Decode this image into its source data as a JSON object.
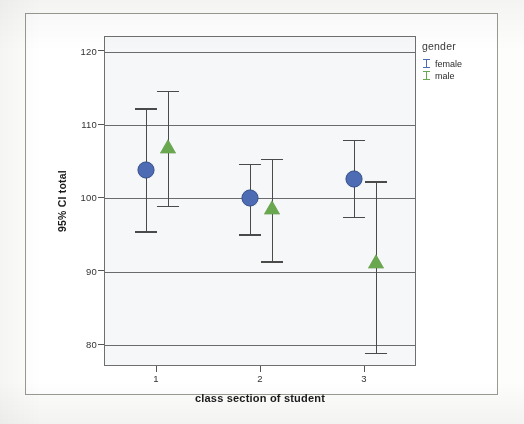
{
  "chart_data": {
    "type": "scatter",
    "title": "",
    "subtitle": "",
    "xlabel": "class section of student",
    "ylabel": "95% CI total",
    "categories": [
      "1",
      "2",
      "3"
    ],
    "xtick_labels": [
      "1",
      "2",
      "3"
    ],
    "ytick_labels": [
      "80",
      "90",
      "100",
      "110",
      "120"
    ],
    "ytick_values": [
      80,
      90,
      100,
      110,
      120
    ],
    "ylim": [
      77,
      122
    ],
    "grid": "horizontal",
    "legend_position": "right",
    "legend_title": "gender",
    "error_bar_type": "95% CI",
    "series": [
      {
        "name": "female",
        "color": "#4d6cb3",
        "marker": "circle",
        "points": [
          {
            "category": "1",
            "mean": 103.8,
            "ci_lower": 95.5,
            "ci_upper": 112.3
          },
          {
            "category": "2",
            "mean": 100.0,
            "ci_lower": 95.1,
            "ci_upper": 104.7
          },
          {
            "category": "3",
            "mean": 102.7,
            "ci_lower": 97.5,
            "ci_upper": 108.0
          }
        ]
      },
      {
        "name": "male",
        "color": "#6aa84f",
        "marker": "triangle",
        "points": [
          {
            "category": "1",
            "mean": 106.8,
            "ci_lower": 99.0,
            "ci_upper": 114.7
          },
          {
            "category": "2",
            "mean": 98.6,
            "ci_lower": 91.4,
            "ci_upper": 105.4
          },
          {
            "category": "3",
            "mean": 91.2,
            "ci_lower": 78.9,
            "ci_upper": 102.3
          }
        ]
      }
    ]
  },
  "axes": {
    "y_title": "95% CI total",
    "x_title": "class section of student",
    "y_ticks": [
      {
        "label": "120",
        "value": 120
      },
      {
        "label": "110",
        "value": 110
      },
      {
        "label": "100",
        "value": 100
      },
      {
        "label": "90",
        "value": 90
      },
      {
        "label": "80",
        "value": 80
      }
    ],
    "x_ticks": [
      {
        "label": "1",
        "value": 1
      },
      {
        "label": "2",
        "value": 2
      },
      {
        "label": "3",
        "value": 3
      }
    ]
  },
  "legend": {
    "title": "gender",
    "items": [
      {
        "label": "female",
        "color": "#4d6cb3"
      },
      {
        "label": "male",
        "color": "#6aa84f"
      }
    ]
  },
  "colors": {
    "female": "#4d6cb3",
    "male": "#6aa84f",
    "plot_background": "#f5f7f8",
    "gridline": "#6b6b6b",
    "errorbar": "#4a4a4a",
    "frame": "#6f6f6f",
    "page_background": "#fdfdfc"
  }
}
